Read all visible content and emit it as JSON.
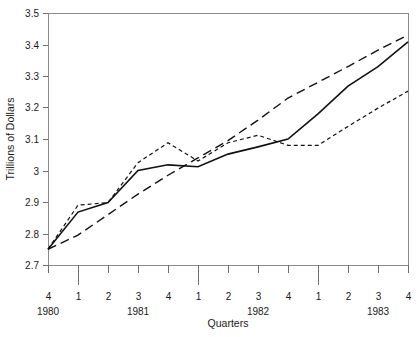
{
  "figure": {
    "width": 419,
    "height": 337,
    "background": "#ffffff",
    "title_partial": "",
    "ink_color": "#111111",
    "axis_color": "#8a8a8a",
    "text_color": "#1a1a1a"
  },
  "chart_data": {
    "type": "line",
    "title": "",
    "xlabel": "Quarters",
    "ylabel": "Trillions of Dollars",
    "ylim": [
      2.7,
      3.5
    ],
    "ytick_values": [
      2.7,
      2.8,
      2.9,
      3.0,
      3.1,
      3.2,
      3.3,
      3.4,
      3.5
    ],
    "ytick_labels": [
      "2.7",
      "2.8",
      "2.9",
      "3",
      "3.1",
      "3.2",
      "3.3",
      "3.4",
      "3.5"
    ],
    "grid": false,
    "legend": "none",
    "x": [
      "1980 Q4",
      "1981 Q1",
      "1981 Q2",
      "1981 Q3",
      "1981 Q4",
      "1982 Q1",
      "1982 Q2",
      "1982 Q3",
      "1982 Q4",
      "1983 Q1",
      "1983 Q2",
      "1983 Q3",
      "1983 Q4"
    ],
    "categories": [
      "4",
      "1",
      "2",
      "3",
      "4",
      "1",
      "2",
      "3",
      "4",
      "1",
      "2",
      "3",
      "4"
    ],
    "quarter_labels": [
      "4",
      "1",
      "2",
      "3",
      "4",
      "1",
      "2",
      "3",
      "4",
      "1",
      "2",
      "3",
      "4"
    ],
    "year_labels": [
      {
        "text": "1980",
        "at_index": 0
      },
      {
        "text": "1981",
        "at_index": 3
      },
      {
        "text": "1982",
        "at_index": 7
      },
      {
        "text": "1983",
        "at_index": 11
      }
    ],
    "year_boundary_indices": [
      1,
      5,
      9
    ],
    "series": [
      {
        "name": "long-dash-series",
        "style": "long-dash",
        "dasharray": "9,5",
        "width": 1.4,
        "values": [
          2.75,
          2.795,
          2.86,
          2.925,
          2.985,
          3.04,
          3.095,
          3.16,
          3.23,
          3.28,
          3.33,
          3.382,
          3.43
        ]
      },
      {
        "name": "solid-series",
        "style": "solid",
        "dasharray": "none",
        "width": 1.6,
        "values": [
          2.75,
          2.868,
          2.898,
          3.0,
          3.018,
          3.012,
          3.052,
          3.075,
          3.1,
          3.18,
          3.268,
          3.33,
          3.408
        ]
      },
      {
        "name": "short-dash-series",
        "style": "short-dash",
        "dasharray": "4,3",
        "width": 1.2,
        "values": [
          2.75,
          2.89,
          2.898,
          3.025,
          3.088,
          3.03,
          3.088,
          3.112,
          3.08,
          3.08,
          3.14,
          3.198,
          3.252
        ]
      }
    ]
  }
}
